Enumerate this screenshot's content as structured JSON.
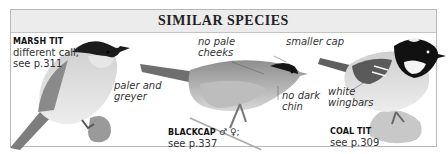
{
  "header": {
    "title": "SIMILAR SPECIES"
  },
  "species": [
    {
      "name": "MARSH TIT",
      "line1": "different call;",
      "line2": "see p.311",
      "notes": [
        {
          "text": "paler and",
          "text2": "greyer"
        }
      ]
    },
    {
      "name": "BLACKCAP",
      "sex_symbols": "♂ ♀;",
      "line1": "see p.337",
      "notes": [
        {
          "text": "no pale",
          "text2": "cheeks"
        },
        {
          "text": "smaller cap"
        },
        {
          "text": "no dark",
          "text2": "chin"
        }
      ]
    },
    {
      "name": "COAL TIT",
      "line1": "see p.309",
      "notes": [
        {
          "text": "white",
          "text2": "wingbars"
        }
      ]
    }
  ],
  "colors": {
    "border": "#b9b9b9",
    "header_bg": "#ececec",
    "text": "#333333"
  }
}
